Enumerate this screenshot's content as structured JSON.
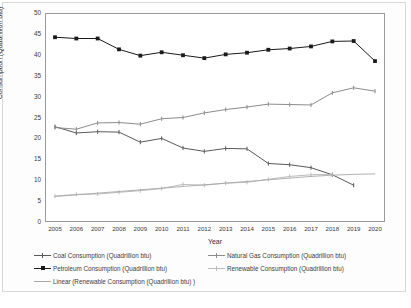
{
  "chart_data": {
    "type": "line",
    "title": "",
    "xlabel": "Year",
    "ylabel": "Consumption (Quadrillion btu)",
    "categories": [
      "2005",
      "2006",
      "2007",
      "2008",
      "2009",
      "2010",
      "2011",
      "2012",
      "2013",
      "2014",
      "2015",
      "2016",
      "2017",
      "2018",
      "2019",
      "2020"
    ],
    "x": [
      2005,
      2006,
      2007,
      2008,
      2009,
      2010,
      2011,
      2012,
      2013,
      2014,
      2015,
      2016,
      2017,
      2018,
      2019,
      2020
    ],
    "xlim": [
      2005,
      2020
    ],
    "ylim": [
      0,
      50
    ],
    "yticks": [
      0,
      5,
      10,
      15,
      20,
      25,
      30,
      35,
      40,
      45,
      50
    ],
    "ytick_labels": [
      "0",
      "5",
      "10",
      "15",
      "20",
      "25",
      "30",
      "35",
      "40",
      "45",
      "50"
    ],
    "grid": false,
    "legend_position": "bottom",
    "series": [
      {
        "name": "Coal Consumption (Quadrillion btu)",
        "color": "#595959",
        "marker": "tick",
        "values": [
          22.8,
          21.3,
          21.6,
          21.5,
          19.1,
          20.0,
          17.7,
          16.9,
          17.6,
          17.5,
          14.0,
          13.7,
          13.0,
          11.3,
          8.8,
          null
        ]
      },
      {
        "name": "Natural Gas Consumption (Quadrillion btu)",
        "color": "#8c8c8c",
        "marker": "tick",
        "values": [
          22.6,
          22.2,
          23.7,
          23.8,
          23.4,
          24.7,
          25.0,
          26.1,
          26.9,
          27.5,
          28.2,
          28.1,
          28.0,
          30.9,
          32.1,
          31.3
        ]
      },
      {
        "name": "Petroleum Consumption (Quadrillion btu)",
        "color": "#1a1a1a",
        "marker": "square",
        "values": [
          44.2,
          43.9,
          43.9,
          41.3,
          39.8,
          40.6,
          39.9,
          39.2,
          40.1,
          40.5,
          41.2,
          41.5,
          42.0,
          43.2,
          43.3,
          38.5
        ]
      },
      {
        "name": "Renewable Consumption (Quadrillion btu)",
        "color": "#bcbcbc",
        "marker": "tick",
        "values": [
          6.2,
          6.6,
          6.7,
          7.1,
          7.5,
          8.0,
          9.0,
          8.8,
          9.3,
          9.5,
          10.2,
          10.9,
          11.3,
          11.4,
          null,
          null
        ]
      },
      {
        "name": "Linear (Renewable Consumption (Quadrillion btu) )",
        "color": "#a8a8a8",
        "marker": "none",
        "trendline": true,
        "values": [
          6.1,
          6.5,
          6.9,
          7.3,
          7.7,
          8.1,
          8.5,
          8.9,
          9.3,
          9.7,
          10.1,
          10.5,
          10.9,
          11.2,
          11.4,
          11.5
        ]
      }
    ]
  },
  "axes": {
    "y_title": "Consumption (Quadrillion btu)",
    "x_title": "Year",
    "y_tick_labels": [
      "50",
      "45",
      "40",
      "35",
      "30",
      "25",
      "20",
      "15",
      "10",
      "5",
      "0"
    ],
    "x_tick_labels": [
      "2005",
      "2006",
      "2007",
      "2008",
      "2009",
      "2010",
      "2011",
      "2012",
      "2013",
      "2014",
      "2015",
      "2016",
      "2017",
      "2018",
      "2019",
      "2020"
    ]
  },
  "legend": {
    "items": [
      {
        "label": "Coal Consumption (Quadrillion btu)",
        "color": "#595959",
        "marker": "tick",
        "col": 0,
        "row": 0
      },
      {
        "label": "Natural Gas Consumption (Quadrillion btu)",
        "color": "#8c8c8c",
        "marker": "tick",
        "col": 1,
        "row": 0
      },
      {
        "label": "Petroleum Consumption (Quadrillion btu)",
        "color": "#1a1a1a",
        "marker": "square",
        "col": 0,
        "row": 1
      },
      {
        "label": "Renewable Consumption (Quadrillion btu)",
        "color": "#bcbcbc",
        "marker": "tick",
        "col": 1,
        "row": 1
      },
      {
        "label": "Linear (Renewable Consumption (Quadrillion btu) )",
        "color": "#a8a8a8",
        "marker": "none",
        "col": 0,
        "row": 2
      }
    ]
  },
  "colors": {
    "plot_border": "#9a9a9a",
    "figure_border": "#d8d8d8",
    "background": "#ffffff",
    "text": "#3b3b3b"
  }
}
